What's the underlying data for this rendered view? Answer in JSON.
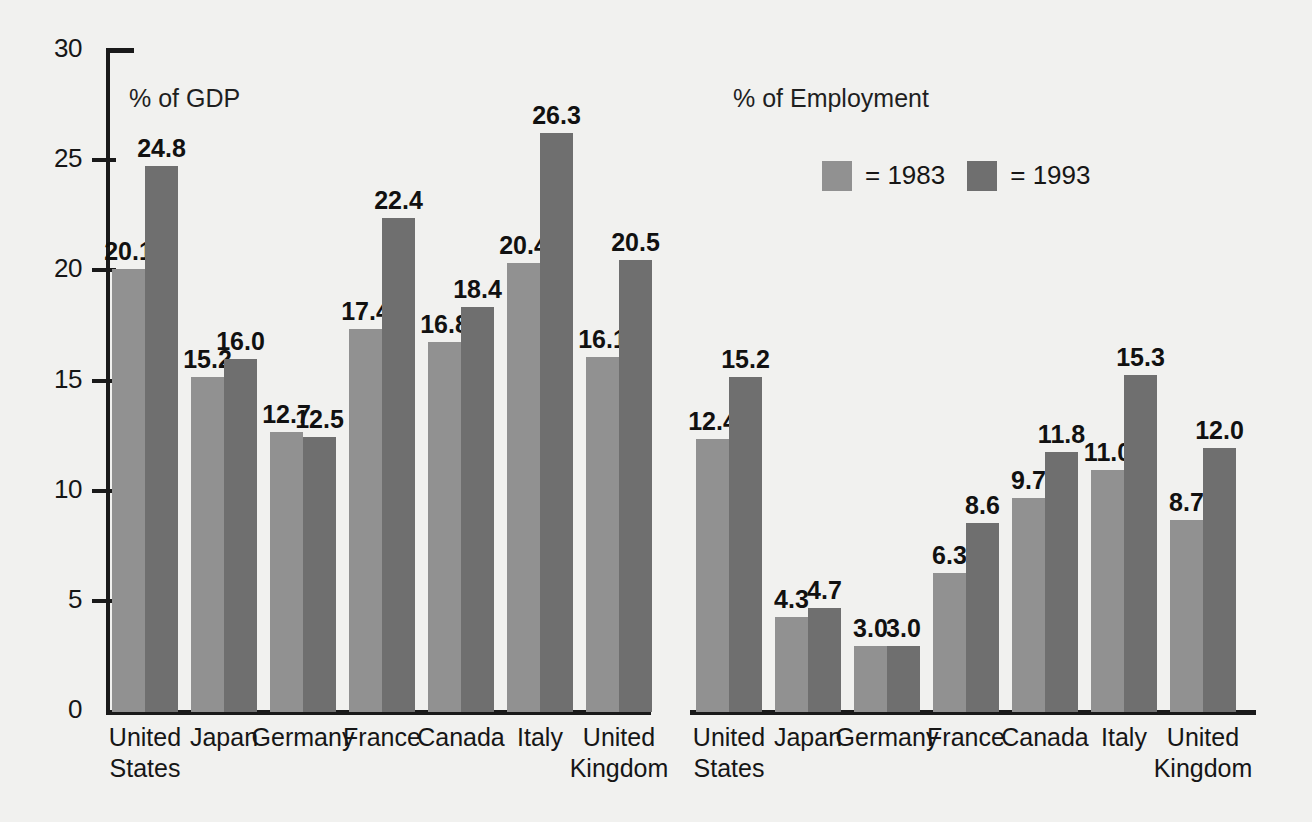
{
  "chart_data": {
    "type": "bar",
    "title": "",
    "xlabel": "",
    "ylabel": "",
    "ylim": [
      0,
      30
    ],
    "ytick_step": 5,
    "yticks": [
      "0",
      "5",
      "10",
      "15",
      "20",
      "25",
      "30"
    ],
    "grid": false,
    "legend_position": "top-right",
    "categories": [
      "United\nStates",
      "Japan",
      "Germany",
      "France",
      "Canada",
      "Italy",
      "United\nKingdom"
    ],
    "panels": [
      {
        "label": "% of GDP",
        "series": [
          {
            "name": "1983",
            "values": [
              20.1,
              15.2,
              12.7,
              17.4,
              16.8,
              20.4,
              16.1
            ]
          },
          {
            "name": "1993",
            "values": [
              24.8,
              16.0,
              12.5,
              22.4,
              18.4,
              26.3,
              20.5
            ]
          }
        ]
      },
      {
        "label": "% of Employment",
        "series": [
          {
            "name": "1983",
            "values": [
              12.4,
              4.3,
              3.0,
              6.3,
              9.7,
              11.0,
              8.7
            ]
          },
          {
            "name": "1993",
            "values": [
              15.2,
              4.7,
              3.0,
              8.6,
              11.8,
              15.3,
              12.0
            ]
          }
        ]
      }
    ],
    "colors": {
      "series_1983": "#919191",
      "series_1993": "#6f6f6f",
      "axis": "#1a1a1a",
      "background": "#f1f1ef",
      "text": "#161616"
    }
  },
  "legend": {
    "items": [
      {
        "swatch_color": "#919191",
        "label": "= 1983"
      },
      {
        "swatch_color": "#6f6f6f",
        "label": "= 1993"
      }
    ]
  }
}
